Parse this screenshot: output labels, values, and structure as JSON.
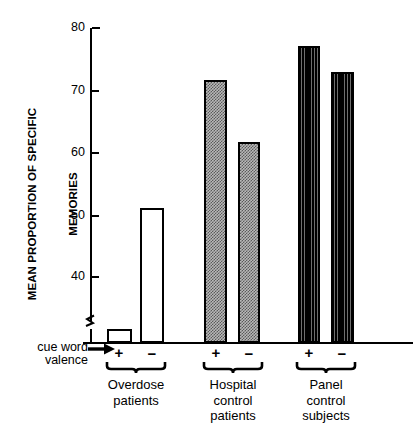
{
  "chart_data": {
    "type": "bar",
    "title": "",
    "ylabel": "MEAN PROPORTION OF SPECIFIC MEMORIES",
    "ylabel_line1": "MEAN PROPORTION OF SPECIFIC",
    "ylabel_line2": "MEMORIES",
    "xlabel": "cue word valence",
    "xlabel_line1": "cue word",
    "xlabel_line2": "valence",
    "ylim": [
      40,
      80
    ],
    "yticks": [
      40,
      50,
      60,
      70,
      80
    ],
    "ytick_labels": [
      "40",
      "50",
      "60",
      "70",
      "80"
    ],
    "axis_break": true,
    "grid": false,
    "legend": "none",
    "categories": [
      "Overdose patients",
      "Hospital control patients",
      "Panel control subjects"
    ],
    "series": [
      {
        "name": "+",
        "values": [
          41.6,
          73.4,
          77.7
        ]
      },
      {
        "name": "−",
        "values": [
          57.0,
          65.5,
          74.4
        ]
      }
    ],
    "bars": [
      {
        "group": "Overdose patients",
        "valence": "+",
        "value": 41.6,
        "fill": "open"
      },
      {
        "group": "Overdose patients",
        "valence": "−",
        "value": 57.0,
        "fill": "open"
      },
      {
        "group": "Hospital control patients",
        "valence": "+",
        "value": 73.4,
        "fill": "stipple"
      },
      {
        "group": "Hospital control patients",
        "valence": "−",
        "value": 65.5,
        "fill": "stipple"
      },
      {
        "group": "Panel control subjects",
        "valence": "+",
        "value": 77.7,
        "fill": "vstripe"
      },
      {
        "group": "Panel control subjects",
        "valence": "−",
        "value": 74.4,
        "fill": "vstripe"
      }
    ],
    "group_label_lines": [
      [
        "Overdose",
        "patients"
      ],
      [
        "Hospital",
        "control",
        "patients"
      ],
      [
        "Panel",
        "control",
        "subjects"
      ]
    ],
    "valence_signs": [
      "+",
      "−",
      "+",
      "−",
      "+",
      "−"
    ],
    "colors": {
      "axis": "#000000",
      "bar_outline": "#000000",
      "open_fill": "#ffffff",
      "stipple_fill": "#a8a8a8",
      "vstripe_fill": "#1a1a1a",
      "background": "#ffffff"
    }
  },
  "ticks": {
    "t80": "80",
    "t70": "70",
    "t60": "60",
    "t50": "50",
    "t40": "40"
  },
  "signs": {
    "s0": "+",
    "s1": "−",
    "s2": "+",
    "s3": "−",
    "s4": "+",
    "s5": "−"
  },
  "groups": {
    "g0l0": "Overdose",
    "g0l1": "patients",
    "g1l0": "Hospital",
    "g1l1": "control",
    "g1l2": "patients",
    "g2l0": "Panel",
    "g2l1": "control",
    "g2l2": "subjects"
  },
  "axis": {
    "ylabel_line1": "MEAN PROPORTION OF SPECIFIC",
    "ylabel_line2": "MEMORIES",
    "cue_line1": "cue word",
    "cue_line2": "valence"
  }
}
